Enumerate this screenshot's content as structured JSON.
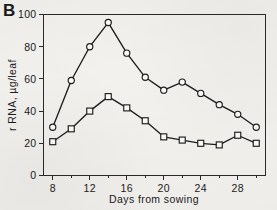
{
  "panel": {
    "label": "B"
  },
  "chart_data": {
    "type": "line",
    "title": "",
    "subtitle": "",
    "xlabel": "Days from sowing",
    "ylabel": "r RNA, µg/leaf",
    "xlim": [
      7,
      31
    ],
    "ylim": [
      0,
      100
    ],
    "grid": false,
    "legend": "none",
    "x": [
      8,
      10,
      12,
      14,
      16,
      18,
      20,
      22,
      24,
      26,
      28,
      30
    ],
    "xticks": [
      8,
      12,
      16,
      20,
      24,
      28
    ],
    "xticklabels": [
      "8",
      "12",
      "16",
      "20",
      "24",
      "28"
    ],
    "xminorticks": [
      10,
      14,
      18,
      22,
      26,
      30
    ],
    "yticks": [
      0,
      20,
      40,
      60,
      80,
      100
    ],
    "yticklabels": [
      "0",
      "20",
      "40",
      "60",
      "80",
      "100"
    ],
    "series": [
      {
        "name": "upper-curve",
        "marker": "open-circle",
        "values": [
          30,
          59,
          80,
          95,
          76,
          61,
          53,
          58,
          51,
          44,
          38,
          30
        ]
      },
      {
        "name": "lower-curve",
        "marker": "open-square",
        "values": [
          21,
          29,
          40,
          49,
          42,
          34,
          24,
          22,
          20,
          19,
          25,
          20
        ]
      }
    ],
    "annotations": []
  }
}
